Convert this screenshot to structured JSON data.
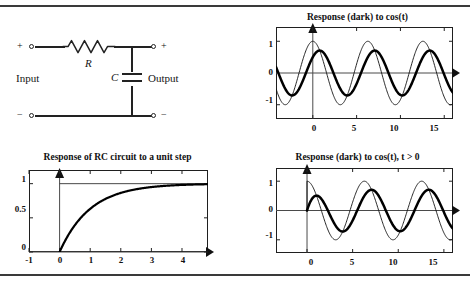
{
  "page": {
    "rules": [
      "top-rule",
      "bottom-rule"
    ]
  },
  "circuit": {
    "name": "RC low-pass circuit",
    "resistor_label": "R",
    "capacitor_label": "C",
    "input_label": "Input",
    "output_label": "Output",
    "terminal_plus_left": "+",
    "terminal_minus_left": "−",
    "terminal_plus_right": "+",
    "terminal_minus_right": "−"
  },
  "chart_data": [
    {
      "id": "response-cos-full",
      "type": "line",
      "title": "Response (dark) to cos(t)",
      "xlabel": "",
      "ylabel": "",
      "xlim": [
        -4.2,
        16.0
      ],
      "ylim": [
        -1.45,
        1.45
      ],
      "xticks": [
        0,
        5,
        10,
        15
      ],
      "xticklabels": [
        "0",
        "5",
        "10",
        "15"
      ],
      "yticks": [
        -1,
        0,
        1
      ],
      "yticklabels": [
        "-1",
        "0",
        "1"
      ],
      "grid": false,
      "legend": "none",
      "axis_arrows": [
        "y-up",
        "x-right"
      ],
      "series": [
        {
          "name": "cos(t)",
          "style": "thin",
          "amplitude": 1.0,
          "phase_deg": 0,
          "formula": "cos(t)"
        },
        {
          "name": "response (dark)",
          "style": "thick",
          "amplitude": 0.707,
          "phase_deg": -45,
          "formula": "0.707*cos(t - 45deg)"
        }
      ]
    },
    {
      "id": "rc-unit-step",
      "type": "line",
      "title": "Response of RC circuit to a unit step",
      "xlabel": "",
      "ylabel": "",
      "xlim": [
        -1.0,
        4.85
      ],
      "ylim": [
        0,
        1.2
      ],
      "xticks": [
        -1,
        0,
        1,
        2,
        3,
        4
      ],
      "xticklabels": [
        "-1",
        "0",
        "1",
        "2",
        "3",
        "4"
      ],
      "yticks": [
        0,
        0.5,
        1
      ],
      "yticklabels": [
        "0",
        "0.5",
        "1"
      ],
      "grid": false,
      "legend": "none",
      "axis_arrows": [
        "y-up",
        "x-right"
      ],
      "asymptote": 1,
      "series": [
        {
          "name": "1 - e^{-t}",
          "style": "thick",
          "formula": "1-exp(-t) for t>=0, 0 for t<0"
        }
      ]
    },
    {
      "id": "response-cos-causal",
      "type": "line",
      "title": "Response (dark) to  cos(t), t > 0",
      "xlabel": "",
      "ylabel": "",
      "xlim": [
        -3.4,
        16.0
      ],
      "ylim": [
        -1.45,
        1.45
      ],
      "xticks": [
        0,
        5,
        10,
        15
      ],
      "xticklabels": [
        "0",
        "5",
        "10",
        "15"
      ],
      "yticks": [
        -1,
        0,
        1
      ],
      "yticklabels": [
        "-1",
        "0",
        "1"
      ],
      "grid": false,
      "legend": "none",
      "axis_arrows": [
        "y-up",
        "x-right"
      ],
      "series": [
        {
          "name": "cos(t), t>0",
          "style": "thin",
          "amplitude": 1.0,
          "phase_deg": 0,
          "formula": "cos(t) for t>0"
        },
        {
          "name": "response (dark)",
          "style": "thick",
          "amplitude": 0.707,
          "phase_deg": -45,
          "formula": "0.707*cos(t-45deg) - 0.5*exp(-t), t>0"
        }
      ]
    }
  ]
}
